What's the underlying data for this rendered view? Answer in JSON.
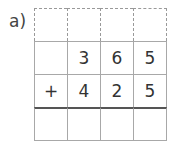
{
  "problem": {
    "label": "a)",
    "carry_row": [
      "",
      "",
      "",
      ""
    ],
    "rows": [
      [
        "",
        "3",
        "6",
        "5"
      ],
      [
        "+",
        "4",
        "2",
        "5"
      ]
    ],
    "answer_row": [
      "",
      "",
      "",
      ""
    ]
  }
}
